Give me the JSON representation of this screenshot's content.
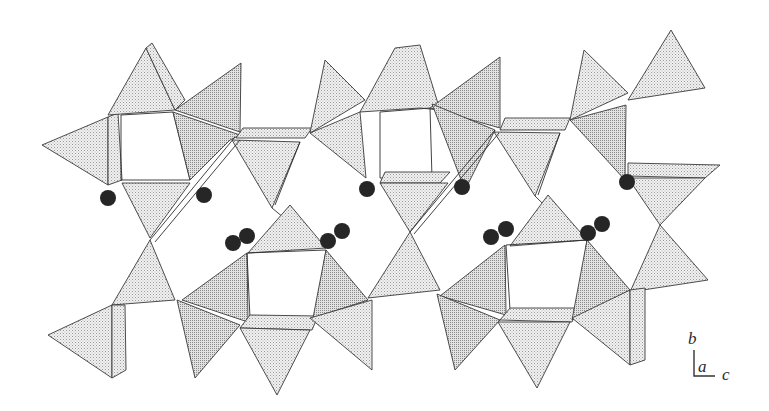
{
  "figure": {
    "type": "crystal-structure-polyhedral-projection",
    "background": "#ffffff",
    "polyhedra_fill": "#d9d9d9",
    "atom_color": "#262626"
  },
  "axes": {
    "vertical_label": "b",
    "depth_label": "a",
    "horizontal_label": "c"
  },
  "atoms": [
    {
      "x": 108,
      "y": 198,
      "r": 8
    },
    {
      "x": 204,
      "y": 195,
      "r": 8
    },
    {
      "x": 233,
      "y": 243,
      "r": 8
    },
    {
      "x": 247,
      "y": 236,
      "r": 8
    },
    {
      "x": 328,
      "y": 241,
      "r": 8
    },
    {
      "x": 342,
      "y": 231,
      "r": 8
    },
    {
      "x": 367,
      "y": 189,
      "r": 8
    },
    {
      "x": 462,
      "y": 187,
      "r": 8
    },
    {
      "x": 491,
      "y": 237,
      "r": 8
    },
    {
      "x": 506,
      "y": 229,
      "r": 8
    },
    {
      "x": 588,
      "y": 233,
      "r": 8
    },
    {
      "x": 602,
      "y": 224,
      "r": 8
    },
    {
      "x": 627,
      "y": 182,
      "r": 8
    }
  ]
}
